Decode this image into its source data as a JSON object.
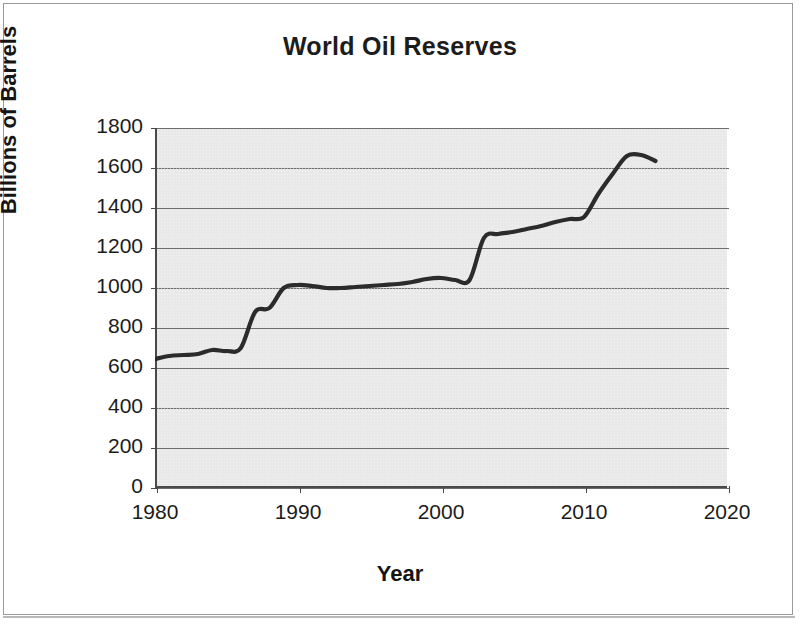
{
  "chart_data": {
    "type": "line",
    "title": "World Oil Reserves",
    "xlabel": "Year",
    "ylabel": "Billions of Barrels",
    "xlim": [
      1980,
      2020
    ],
    "ylim": [
      0,
      1800
    ],
    "xticks": [
      1980,
      1990,
      2000,
      2010,
      2020
    ],
    "xtick_labels": [
      "1980",
      "1990",
      "2000",
      "2010",
      "2020"
    ],
    "yticks": [
      0,
      200,
      400,
      600,
      800,
      1000,
      1200,
      1400,
      1600,
      1800
    ],
    "ytick_labels": [
      "0",
      "200",
      "400",
      "600",
      "800",
      "1000",
      "1200",
      "1400",
      "1600",
      "1800"
    ],
    "grid": "horizontal",
    "legend": "none",
    "plot_background": "#e9e9e9",
    "line_color": "#2b2b2b",
    "x": [
      1980,
      1981,
      1982,
      1983,
      1984,
      1985,
      1986,
      1987,
      1988,
      1989,
      1990,
      1991,
      1992,
      1993,
      1994,
      1995,
      1996,
      1997,
      1998,
      1999,
      2000,
      2001,
      2002,
      2003,
      2004,
      2005,
      2006,
      2007,
      2008,
      2009,
      2010,
      2011,
      2012,
      2013,
      2014,
      2015
    ],
    "values": [
      645,
      660,
      665,
      670,
      690,
      685,
      700,
      880,
      900,
      1000,
      1015,
      1010,
      1000,
      1000,
      1005,
      1010,
      1015,
      1020,
      1030,
      1045,
      1050,
      1040,
      1040,
      1250,
      1270,
      1280,
      1295,
      1310,
      1330,
      1345,
      1355,
      1470,
      1570,
      1660,
      1665,
      1635
    ],
    "series": [
      {
        "name": "World oil reserves",
        "values": [
          645,
          660,
          665,
          670,
          690,
          685,
          700,
          880,
          900,
          1000,
          1015,
          1010,
          1000,
          1000,
          1005,
          1010,
          1015,
          1020,
          1030,
          1045,
          1050,
          1040,
          1040,
          1250,
          1270,
          1280,
          1295,
          1310,
          1330,
          1345,
          1355,
          1470,
          1570,
          1660,
          1665,
          1635
        ]
      }
    ]
  },
  "chart": {
    "title": "World Oil Reserves",
    "x_axis_title": "Year",
    "y_axis_title": "Billions of Barrels"
  }
}
